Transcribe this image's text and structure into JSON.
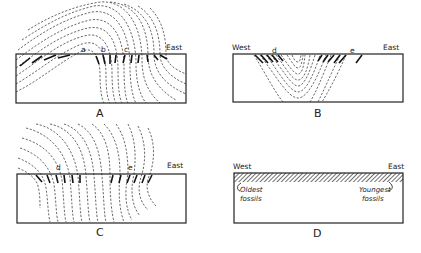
{
  "figure": {
    "panels": [
      {
        "id": "A",
        "label": "A",
        "direction_labels": {
          "east": "East"
        },
        "point_labels": [
          "a",
          "b",
          "c"
        ]
      },
      {
        "id": "B",
        "label": "B",
        "direction_labels": {
          "west": "West",
          "east": "East"
        },
        "point_labels": [
          "d",
          "e"
        ]
      },
      {
        "id": "C",
        "label": "C",
        "direction_labels": {
          "east": "East"
        },
        "point_labels": [
          "d",
          "e"
        ]
      },
      {
        "id": "D",
        "label": "D",
        "direction_labels": {
          "west": "West",
          "east": "East"
        },
        "annotations": {
          "oldest_line1": "Oldest",
          "oldest_line2": "fossils",
          "youngest_line1": "Youngest",
          "youngest_line2": "fossils"
        }
      }
    ]
  }
}
